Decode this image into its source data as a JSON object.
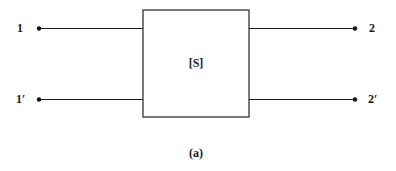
{
  "diagram": {
    "block": {
      "label": "[S]"
    },
    "ports": {
      "p1": {
        "label": "1"
      },
      "p1prime": {
        "label": "1′"
      },
      "p2": {
        "label": "2"
      },
      "p2prime": {
        "label": "2′"
      }
    },
    "caption": "(a)",
    "colors": {
      "line": "#222222",
      "text": "#1a1a1a",
      "background": "#ffffff"
    }
  }
}
